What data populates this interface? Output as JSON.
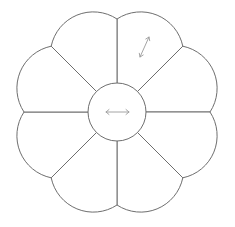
{
  "diagram": {
    "type": "radial-pie-menu",
    "segment_count": 8,
    "center": {
      "x": 117,
      "y": 112
    },
    "hub_radius": 29,
    "cusp_radius": 93,
    "petal_arc_radius": 43,
    "colors": {
      "outline": "#6e6e6e",
      "arrow": "#9a9a9a",
      "fill": "#ffffff"
    },
    "hub_icon": "horizontal-double-arrow-icon",
    "segments": [
      {
        "index": 0,
        "icon": "diagonal-double-arrow-icon"
      },
      {
        "index": 1,
        "icon": null
      },
      {
        "index": 2,
        "icon": null
      },
      {
        "index": 3,
        "icon": null
      },
      {
        "index": 4,
        "icon": null
      },
      {
        "index": 5,
        "icon": null
      },
      {
        "index": 6,
        "icon": null
      },
      {
        "index": 7,
        "icon": null
      }
    ]
  }
}
